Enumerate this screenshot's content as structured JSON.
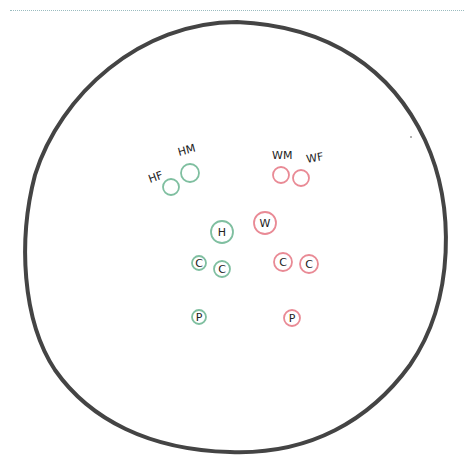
{
  "header": {
    "title": ""
  },
  "colors": {
    "outline": "#444444",
    "green": "#7fbfa0",
    "red": "#e98a95",
    "ink": "#222222",
    "rule": "#9bbcc0"
  },
  "diagram": {
    "outer_circle": {
      "cx": 237,
      "cy": 248,
      "rx": 215,
      "ry": 212
    },
    "groups": [
      {
        "name": "left-group",
        "color": "green",
        "nodes": [
          {
            "label": "HF",
            "cx": 171,
            "cy": 187,
            "r": 8,
            "label_x": 150,
            "label_y": 183,
            "label_rot": -20,
            "inside": false
          },
          {
            "label": "HM",
            "cx": 190,
            "cy": 173,
            "r": 9,
            "label_x": 179,
            "label_y": 156,
            "label_rot": -15,
            "inside": false
          },
          {
            "label": "H",
            "cx": 222,
            "cy": 232,
            "r": 11,
            "inside": true
          },
          {
            "label": "C",
            "cx": 199,
            "cy": 263,
            "r": 7,
            "inside": true
          },
          {
            "label": "C",
            "cx": 222,
            "cy": 269,
            "r": 8,
            "inside": true
          },
          {
            "label": "P",
            "cx": 199,
            "cy": 317,
            "r": 7,
            "inside": true
          }
        ]
      },
      {
        "name": "right-group",
        "color": "red",
        "nodes": [
          {
            "label": "WM",
            "cx": 281,
            "cy": 175,
            "r": 8,
            "label_x": 272,
            "label_y": 159,
            "label_rot": 0,
            "inside": false
          },
          {
            "label": "WF",
            "cx": 301,
            "cy": 178,
            "r": 8,
            "label_x": 307,
            "label_y": 163,
            "label_rot": -10,
            "inside": false
          },
          {
            "label": "W",
            "cx": 265,
            "cy": 223,
            "r": 11,
            "inside": true
          },
          {
            "label": "C",
            "cx": 283,
            "cy": 262,
            "r": 9,
            "inside": true
          },
          {
            "label": "C",
            "cx": 309,
            "cy": 264,
            "r": 9,
            "inside": true
          },
          {
            "label": "P",
            "cx": 292,
            "cy": 318,
            "r": 8,
            "inside": true
          }
        ]
      }
    ]
  }
}
